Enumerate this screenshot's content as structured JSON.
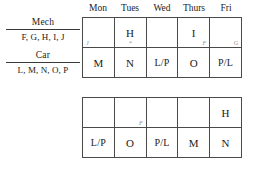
{
  "legend": {
    "groups": [
      {
        "title": "Mech",
        "members": "F, G, H, I, J"
      },
      {
        "title": "Car",
        "members": "L, M, N, O, P"
      }
    ]
  },
  "day_header": {
    "days": [
      "Mon",
      "Tues",
      "Wed",
      "Thurs",
      "Fri"
    ]
  },
  "grids": [
    {
      "name": "grid-1",
      "rows": [
        {
          "cells": [
            {
              "value": "",
              "mark": "J",
              "mark_pos": "mark-left"
            },
            {
              "value": "H",
              "mark": "*",
              "mark_pos": "mark-center"
            },
            {
              "value": "",
              "mark": "",
              "mark_pos": "mark-left"
            },
            {
              "value": "I",
              "mark": "F",
              "mark_pos": "mark-right"
            },
            {
              "value": "",
              "mark": "G",
              "mark_pos": "mark-right"
            }
          ]
        },
        {
          "cells": [
            {
              "value": "M",
              "mark": "",
              "mark_pos": "mark-left"
            },
            {
              "value": "N",
              "mark": "",
              "mark_pos": "mark-left"
            },
            {
              "value": "L/P",
              "mark": "",
              "mark_pos": "mark-left"
            },
            {
              "value": "O",
              "mark": "",
              "mark_pos": "mark-left"
            },
            {
              "value": "P/L",
              "mark": "",
              "mark_pos": "mark-left"
            }
          ]
        }
      ]
    },
    {
      "name": "grid-2",
      "rows": [
        {
          "cells": [
            {
              "value": "",
              "mark": "",
              "mark_pos": "mark-left"
            },
            {
              "value": "",
              "mark": "F",
              "mark_pos": "mark-right"
            },
            {
              "value": "",
              "mark": "",
              "mark_pos": "mark-left"
            },
            {
              "value": "",
              "mark": "",
              "mark_pos": "mark-left"
            },
            {
              "value": "H",
              "mark": "",
              "mark_pos": "mark-left"
            }
          ]
        },
        {
          "cells": [
            {
              "value": "L/P",
              "mark": "",
              "mark_pos": "mark-left"
            },
            {
              "value": "O",
              "mark": "",
              "mark_pos": "mark-left"
            },
            {
              "value": "P/L",
              "mark": "",
              "mark_pos": "mark-left"
            },
            {
              "value": "M",
              "mark": "",
              "mark_pos": "mark-left"
            },
            {
              "value": "N",
              "mark": "",
              "mark_pos": "mark-left"
            }
          ]
        }
      ]
    }
  ],
  "colors": {
    "ink": "#1b1b1b",
    "rule": "#4a4a4a",
    "pencil": "#8a8a8a",
    "background": "#ffffff"
  }
}
